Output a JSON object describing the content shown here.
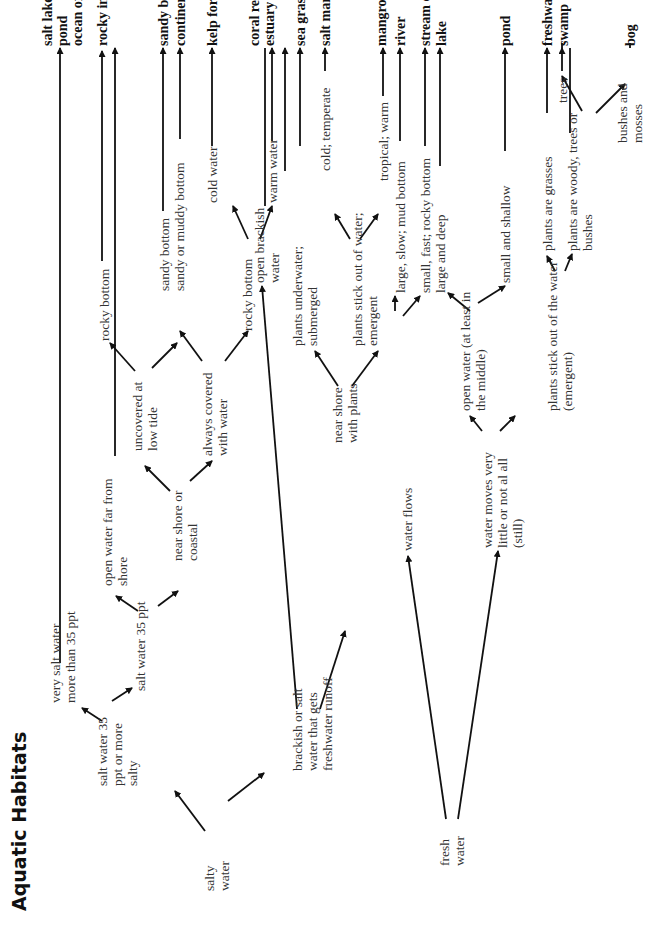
{
  "title": "Aquatic Habitats",
  "nodes": {
    "salty_water": "salty water",
    "fresh_water": "fresh water",
    "salt35more": "salt water 35 ppt or more salty",
    "brackish_runoff": "brackish or salt water that gets freshwater runoff",
    "very_salt": "very salt water more than 35 ppt",
    "salt35": "salt water 35 ppt",
    "open_far": "open water far from shore",
    "near_coastal": "near shore or coastal",
    "uncovered": "uncovered at low tide",
    "always_covered": "always covered with water",
    "rocky1": "rocky bottom",
    "sandy": "sandy bottom",
    "sandy_muddy": "sandy or muddy bottom",
    "rocky2": "rocky bottom",
    "cold_water": "cold water",
    "warm_water": "warm water",
    "open_brackish": "open brackish water",
    "near_plants": "near shore with plants",
    "submerged": "plants underwater; submerged",
    "emergent": "plants stick out of water; emergent",
    "cold_temperate": "cold; temperate",
    "tropical": "tropical; warm",
    "water_flows": "water flows",
    "still": "water moves very little or not al all (still)",
    "large_slow": "large, slow; mud bottom",
    "small_fast": "small, fast; rocky bottom",
    "open_middle": "open water (at least in the middle)",
    "plants_emergent": "plants stick out of the water (emergent)",
    "large_deep": "large and deep",
    "small_shallow": "small and shallow",
    "grasses": "plants are grasses",
    "woody": "plants are woody, trees or bushes",
    "trees": "trees",
    "bushes": "bushes and mosses"
  },
  "habitats": {
    "salt_lake": "salt lake or salt pond",
    "ocean": "ocean or sea",
    "rocky_intertidal": "rocky intertidal",
    "sandy_beach": "sandy beach",
    "continental_shelf": "continental shelf",
    "kelp_forest": "kelp forest",
    "coral_reef": "coral reef",
    "estuary": "estuary",
    "sea_grass": "sea grass bed",
    "salt_marsh": "salt marsh",
    "mangrove": "mangrove swamp",
    "river": "river",
    "stream": "stream or creek",
    "lake": "lake",
    "pond": "pond",
    "freshwater_marsh": "freshwater marsh",
    "swamp": "swamp",
    "bog": "bog"
  }
}
